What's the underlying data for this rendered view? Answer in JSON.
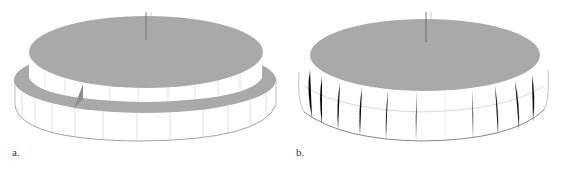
{
  "figure": {
    "panels": [
      {
        "id": "a",
        "label": "a.",
        "description": "Stepped disc with inner raised cylinder and outer ring, notch cut in ring"
      },
      {
        "id": "b",
        "label": "b.",
        "description": "Disc with beveled/rounded outer edge"
      }
    ],
    "colors": {
      "top_face": "#a9a9a9",
      "side_face": "#ffffff",
      "edge_lines": "#c8c8c8",
      "outline": "#8a8a8a",
      "axis": "#666666"
    }
  }
}
